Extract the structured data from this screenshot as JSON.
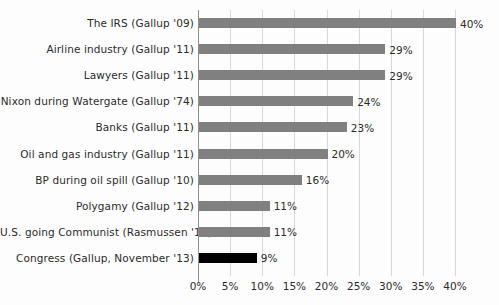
{
  "chart_data": {
    "type": "bar",
    "orientation": "horizontal",
    "title": "",
    "subtitle": "",
    "xlabel": "",
    "ylabel": "",
    "xlim": [
      0,
      40
    ],
    "xtick_labels": [
      "0%",
      "5%",
      "10%",
      "15%",
      "20%",
      "25%",
      "30%",
      "35%",
      "40%"
    ],
    "xtick_values": [
      0,
      5,
      10,
      15,
      20,
      25,
      30,
      35,
      40
    ],
    "grid": true,
    "legend": "none",
    "value_suffix": "%",
    "categories": [
      "The IRS (Gallup '09)",
      "Airline industry (Gallup '11)",
      "Lawyers (Gallup '11)",
      "Nixon during Watergate (Gallup '74)",
      "Banks (Gallup '11)",
      "Oil and gas industry (Gallup '11)",
      "BP during oil spill (Gallup '10)",
      "Polygamy (Gallup '12)",
      "U.S. going Communist (Rasmussen '11)",
      "Congress (Gallup, November '13)"
    ],
    "values": [
      40,
      29,
      29,
      24,
      23,
      20,
      16,
      11,
      11,
      9
    ],
    "value_labels": [
      "40%",
      "29%",
      "29%",
      "24%",
      "23%",
      "20%",
      "16%",
      "11%",
      "11%",
      "9%"
    ],
    "highlight_index": 9,
    "colors": {
      "bar": "#808080",
      "bar_highlight": "#000000",
      "gridline": "#d8d8d8",
      "axis": "#8f8f8f",
      "text": "#2b2b2b",
      "background": "#fdfdfd"
    }
  }
}
